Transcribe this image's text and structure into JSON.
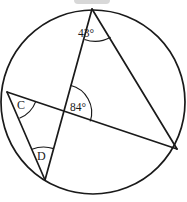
{
  "figure": {
    "stroke_color": "#1a1a1a",
    "background_color": "#ffffff",
    "width": 187,
    "height": 202
  },
  "circle": {
    "center_x": 93,
    "center_y": 102,
    "radius": 92
  },
  "points": {
    "top": {
      "label": "",
      "x": 92,
      "y": 9
    },
    "right": {
      "label": "",
      "x": 177,
      "y": 149
    },
    "bottom": {
      "label": "",
      "x": 45,
      "y": 180
    },
    "left": {
      "label": "C",
      "x": 7,
      "y": 92
    },
    "intersection": {
      "label": "",
      "x": 63,
      "y": 112
    }
  },
  "labels": {
    "angle_top": "43°",
    "angle_intersection": "84°",
    "vertex_c": "C",
    "vertex_d": "D"
  },
  "label_positions": {
    "angle_top": {
      "x": 86,
      "y": 34
    },
    "angle_intersection": {
      "x": 70,
      "y": 108
    },
    "vertex_c": {
      "x": 17,
      "y": 106
    },
    "vertex_d": {
      "x": 37,
      "y": 157
    }
  },
  "chords": [
    {
      "name": "top-to-bottom",
      "from": "top",
      "to": "bottom"
    },
    {
      "name": "top-to-right",
      "from": "top",
      "to": "right"
    },
    {
      "name": "left-to-right",
      "from": "left",
      "to": "right"
    },
    {
      "name": "left-to-bottom",
      "from": "left",
      "to": "bottom"
    }
  ],
  "angle_marks": [
    {
      "name": "arc-43-at-top",
      "value": "43°"
    },
    {
      "name": "arc-84-at-intersection",
      "value": "84°"
    },
    {
      "name": "arc-at-vertex-c",
      "value": ""
    },
    {
      "name": "arc-at-vertex-d",
      "value": ""
    }
  ]
}
